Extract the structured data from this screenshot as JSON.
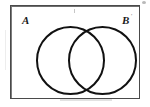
{
  "figure": {
    "type": "venn-diagram",
    "background_color": "#ffffff",
    "stroke_color": "#111111",
    "box_border_color": "#4a4a4a"
  },
  "universal_set": {
    "name": "universal-set-rectangle",
    "label": ""
  },
  "sets": [
    {
      "id": "A",
      "label": "A",
      "position": "left",
      "label_mark": ""
    },
    {
      "id": "B",
      "label": "B",
      "position": "right",
      "label_mark": "'"
    }
  ],
  "artifacts": {
    "top_right": "",
    "top_center": "",
    "bottom_band": "",
    "left_edge": ""
  }
}
